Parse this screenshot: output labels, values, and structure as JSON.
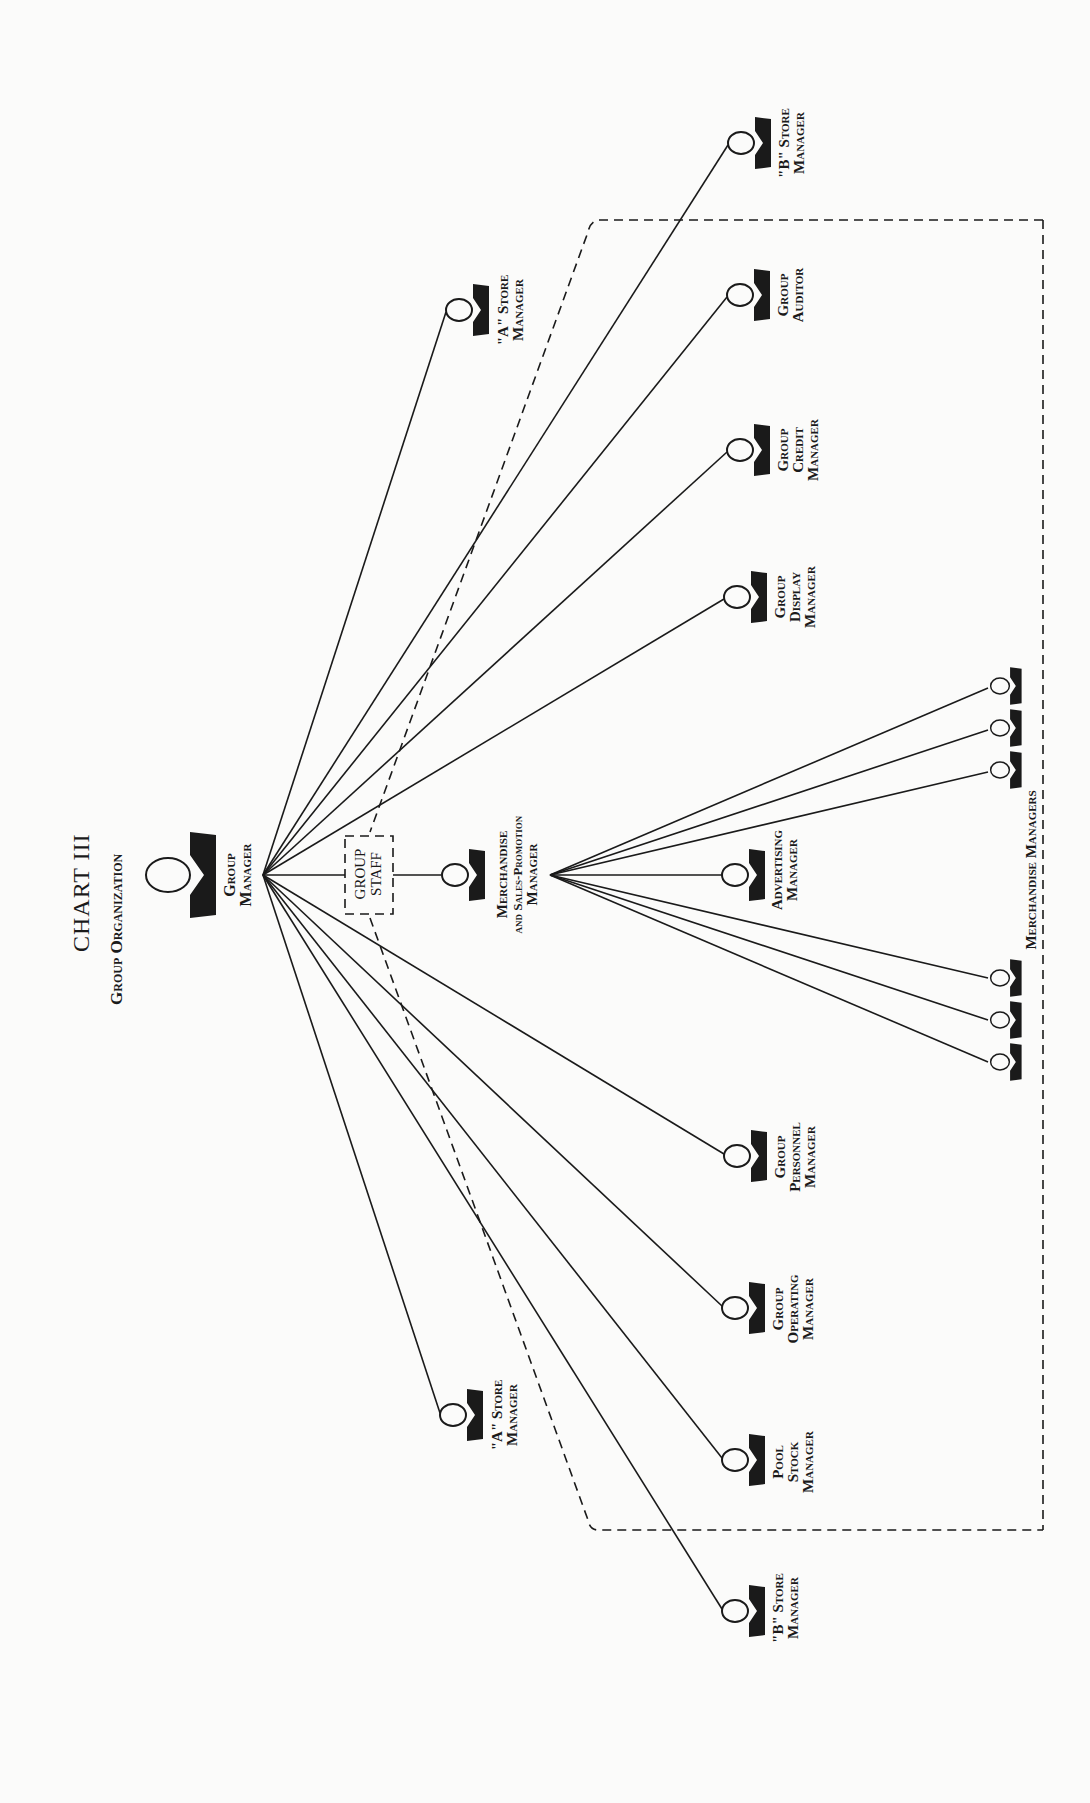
{
  "title": {
    "main": "CHART III",
    "subtitle": "Group Organization"
  },
  "nodes": {
    "group_manager": {
      "lines": [
        "Group",
        "Manager"
      ]
    },
    "group_staff": {
      "lines": [
        "GROUP",
        "STAFF"
      ]
    },
    "merch_sales_promo": {
      "lines": [
        "Merchandise",
        "and Sales-Promotion",
        "Manager"
      ]
    },
    "b_store_top": {
      "lines": [
        "\"B\" Store",
        "Manager"
      ]
    },
    "a_store_top": {
      "lines": [
        "\"A\" Store",
        "Manager"
      ]
    },
    "group_auditor": {
      "lines": [
        "Group",
        "Auditor"
      ]
    },
    "group_credit": {
      "lines": [
        "Group",
        "Credit",
        "Manager"
      ]
    },
    "group_display": {
      "lines": [
        "Group",
        "Display",
        "Manager"
      ]
    },
    "advertising": {
      "lines": [
        "Advertising",
        "Manager"
      ]
    },
    "merchandise_managers": {
      "label": "Merchandise Managers",
      "count": 6
    },
    "group_personnel": {
      "lines": [
        "Group",
        "Personnel",
        "Manager"
      ]
    },
    "group_operating": {
      "lines": [
        "Group",
        "Operating",
        "Manager"
      ]
    },
    "pool_stock": {
      "lines": [
        "Pool",
        "Stock",
        "Manager"
      ]
    },
    "a_store_bottom": {
      "lines": [
        "\"A\" Store",
        "Manager"
      ]
    },
    "b_store_bottom": {
      "lines": [
        "\"B\" Store",
        "Manager"
      ]
    }
  },
  "colors": {
    "background": "#fbfbfa",
    "ink": "#1a1a1a"
  }
}
